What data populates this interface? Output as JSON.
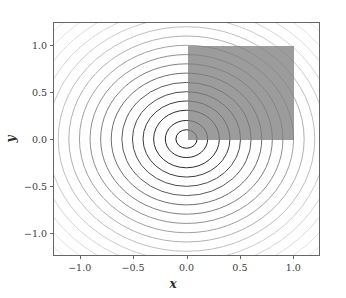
{
  "chart_data": {
    "type": "contour",
    "title": "",
    "xlabel": "x",
    "ylabel": "y",
    "xlim": [
      -1.25,
      1.25
    ],
    "ylim": [
      -1.25,
      1.25
    ],
    "xticks": [
      -1.0,
      -0.5,
      0.0,
      0.5,
      1.0
    ],
    "yticks": [
      -1.0,
      -0.5,
      0.0,
      0.5,
      1.0
    ],
    "xticklabels": [
      "−1.0",
      "−0.5",
      "0.0",
      "0.5",
      "1.0"
    ],
    "yticklabels": [
      "−1.0",
      "−0.5",
      "0.0",
      "0.5",
      "1.0"
    ],
    "grid": false,
    "legend": null,
    "contour_center": [
      0.0,
      0.0
    ],
    "contour_rings": [
      {
        "radius": 0.1,
        "color": "#1a1a1a"
      },
      {
        "radius": 0.2,
        "color": "#242424"
      },
      {
        "radius": 0.31,
        "color": "#2e2e2e"
      },
      {
        "radius": 0.41,
        "color": "#3b3b3b"
      },
      {
        "radius": 0.51,
        "color": "#4a4a4a"
      },
      {
        "radius": 0.61,
        "color": "#5a5a5a"
      },
      {
        "radius": 0.71,
        "color": "#6b6b6b"
      },
      {
        "radius": 0.81,
        "color": "#7d7d7d"
      },
      {
        "radius": 0.91,
        "color": "#8f8f8f"
      },
      {
        "radius": 1.01,
        "color": "#a0a0a0"
      },
      {
        "radius": 1.11,
        "color": "#b0b0b0"
      },
      {
        "radius": 1.21,
        "color": "#bebebe"
      },
      {
        "radius": 1.31,
        "color": "#cacaca"
      },
      {
        "radius": 1.41,
        "color": "#d4d4d4"
      },
      {
        "radius": 1.51,
        "color": "#dcdcdc"
      },
      {
        "radius": 1.61,
        "color": "#e3e3e3"
      },
      {
        "radius": 1.71,
        "color": "#e9e9e9"
      },
      {
        "radius": 1.81,
        "color": "#efefef"
      }
    ],
    "overlay_rect": {
      "x0": 0.0,
      "y0": 0.0,
      "x1": 1.0,
      "y1": 1.0,
      "color": "#808080",
      "opacity": 0.78
    },
    "colors": {
      "spine": "#666666",
      "tick": "#666666",
      "ticklabel": "#3a3a3a",
      "axislabel": "#2b2b2b",
      "background": "#ffffff"
    }
  }
}
